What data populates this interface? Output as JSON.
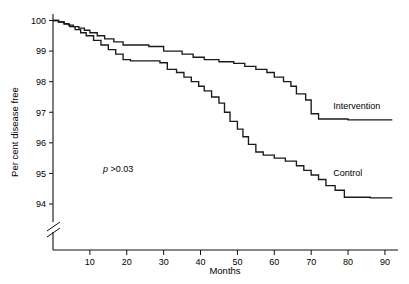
{
  "chart_data": {
    "type": "line",
    "subtype": "step-survival",
    "title": "",
    "xlabel": "Months",
    "ylabel": "Per cent disease free",
    "xlim": [
      0,
      93
    ],
    "ylim": [
      94,
      100
    ],
    "xticks": [
      10,
      20,
      30,
      40,
      50,
      60,
      70,
      80,
      90
    ],
    "yticks": [
      94,
      95,
      96,
      97,
      98,
      99,
      100
    ],
    "xtick_labels": [
      "10",
      "20",
      "30",
      "40",
      "50",
      "60",
      "70",
      "80",
      "90"
    ],
    "ytick_labels": [
      "94",
      "95",
      "96",
      "97",
      "98",
      "99",
      "100"
    ],
    "grid": false,
    "legend": "inline-right-of-curve",
    "y_axis_break": true,
    "annotations": [
      {
        "name": "p-value",
        "text_italic": "p",
        "text": " >0.03",
        "x": 18,
        "y": 95.3
      }
    ],
    "series": [
      {
        "name": "Intervention",
        "label": "Intervention",
        "color": "#1a1a1a",
        "label_x": 76,
        "label_y": 97.1,
        "points": [
          [
            0,
            100.0
          ],
          [
            1.5,
            99.95
          ],
          [
            3.0,
            99.9
          ],
          [
            4.2,
            99.85
          ],
          [
            5.5,
            99.8
          ],
          [
            7.0,
            99.75
          ],
          [
            8.5,
            99.68
          ],
          [
            10.0,
            99.6
          ],
          [
            12.0,
            99.5
          ],
          [
            14.0,
            99.4
          ],
          [
            16.5,
            99.3
          ],
          [
            19.0,
            99.2
          ],
          [
            26.0,
            99.15
          ],
          [
            30.0,
            99.0
          ],
          [
            35.0,
            98.9
          ],
          [
            38.0,
            98.8
          ],
          [
            41.0,
            98.72
          ],
          [
            45.0,
            98.65
          ],
          [
            49.0,
            98.6
          ],
          [
            52.0,
            98.5
          ],
          [
            55.0,
            98.4
          ],
          [
            58.0,
            98.3
          ],
          [
            60.0,
            98.15
          ],
          [
            62.5,
            98.0
          ],
          [
            64.5,
            97.85
          ],
          [
            66.0,
            97.6
          ],
          [
            68.5,
            97.4
          ],
          [
            70.0,
            96.95
          ],
          [
            72.0,
            96.78
          ],
          [
            80.0,
            96.75
          ],
          [
            92.0,
            96.75
          ]
        ]
      },
      {
        "name": "Control",
        "label": "Control",
        "color": "#1a1a1a",
        "label_x": 76,
        "label_y": 94.9,
        "points": [
          [
            0,
            100.0
          ],
          [
            1.5,
            99.95
          ],
          [
            3.0,
            99.88
          ],
          [
            4.5,
            99.8
          ],
          [
            6.0,
            99.7
          ],
          [
            7.5,
            99.6
          ],
          [
            9.0,
            99.5
          ],
          [
            11.0,
            99.35
          ],
          [
            13.0,
            99.2
          ],
          [
            15.0,
            99.05
          ],
          [
            17.0,
            98.9
          ],
          [
            19.0,
            98.72
          ],
          [
            21.0,
            98.68
          ],
          [
            29.0,
            98.62
          ],
          [
            31.0,
            98.4
          ],
          [
            33.5,
            98.3
          ],
          [
            35.5,
            98.15
          ],
          [
            37.5,
            98.0
          ],
          [
            39.5,
            97.85
          ],
          [
            41.0,
            97.7
          ],
          [
            43.0,
            97.5
          ],
          [
            45.0,
            97.3
          ],
          [
            46.5,
            97.0
          ],
          [
            48.0,
            96.7
          ],
          [
            50.0,
            96.45
          ],
          [
            51.5,
            96.2
          ],
          [
            53.0,
            95.95
          ],
          [
            55.0,
            95.7
          ],
          [
            57.0,
            95.6
          ],
          [
            60.0,
            95.5
          ],
          [
            63.0,
            95.4
          ],
          [
            66.0,
            95.25
          ],
          [
            68.0,
            95.1
          ],
          [
            70.0,
            94.95
          ],
          [
            72.0,
            94.8
          ],
          [
            74.0,
            94.6
          ],
          [
            76.5,
            94.45
          ],
          [
            79.0,
            94.22
          ],
          [
            86.0,
            94.2
          ],
          [
            92.0,
            94.2
          ]
        ]
      }
    ]
  },
  "axes": {
    "ylabel": "Per cent disease free",
    "xlabel": "Months"
  }
}
